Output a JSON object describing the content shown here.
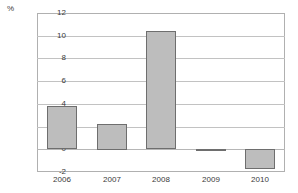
{
  "chart_data": {
    "type": "bar",
    "title": "",
    "subtitle": "",
    "xlabel": "",
    "ylabel": "%",
    "unit_label": "%",
    "categories": [
      "2006",
      "2007",
      "2008",
      "2009",
      "2010"
    ],
    "values": [
      3.8,
      2.25,
      10.4,
      -0.1,
      -1.8
    ],
    "series": [
      {
        "name": "",
        "values": [
          3.8,
          2.25,
          10.4,
          -0.1,
          -1.8
        ]
      }
    ],
    "ylim": [
      -2,
      12
    ],
    "yticks": [
      12,
      10,
      8,
      6,
      4,
      2,
      0,
      -2
    ],
    "ytick_labels": [
      "12",
      "10",
      "8",
      "6",
      "4",
      "2",
      "0",
      "-2"
    ],
    "xtick_labels": [
      "2006",
      "2007",
      "2008",
      "2009",
      "2010"
    ],
    "grid": true,
    "grid_axis": "y",
    "legend": false,
    "legend_position": "none",
    "bar_fill_color": "#bdbdbd",
    "bar_border_color": "#6e6e6e",
    "gridline_color": "#c2c2c2",
    "frame_color": "#b0b0b0",
    "text_color": "#3a3a3a",
    "zero_line": 0
  }
}
